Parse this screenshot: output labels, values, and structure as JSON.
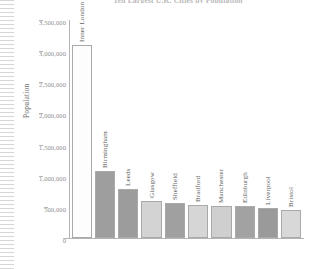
{
  "figure": {
    "title": "Ten Largest U.K. Cities by Population",
    "title_note": "clipped at top edge"
  },
  "axes": {
    "y_axis_title": "Population",
    "y_ticks": [
      "3,500,000",
      "3,000,000",
      "2,500,000",
      "2,000,000",
      "1,500,000",
      "1,000,000",
      "500,000",
      "0"
    ]
  },
  "chart_data": {
    "type": "bar",
    "title": "Ten Largest U.K. Cities by Population",
    "xlabel": "",
    "ylabel": "Population",
    "ylim": [
      0,
      3500000
    ],
    "ytick_values": [
      0,
      500000,
      1000000,
      1500000,
      2000000,
      2500000,
      3000000,
      3500000
    ],
    "ytick_labels": [
      "0",
      "500,000",
      "1,000,000",
      "1,500,000",
      "2,000,000",
      "2,500,000",
      "3,000,000",
      "3,500,000"
    ],
    "grid": false,
    "legend": "none",
    "orientation": "vertical",
    "categories": [
      "Inner London",
      "Birmingham",
      "Leeds",
      "Glasgow",
      "Sheffield",
      "Bradford",
      "Manchester",
      "Edinburgh",
      "Liverpool",
      "Bristol"
    ],
    "values": [
      3100000,
      1080000,
      780000,
      600000,
      560000,
      530000,
      515000,
      510000,
      480000,
      450000
    ],
    "bar_colors": [
      "#fdfdfd",
      "#9e9e9e",
      "#9c9c9c",
      "#d3d3d3",
      "#a0a0a0",
      "#d6d6d6",
      "#cfcfcf",
      "#a2a2a2",
      "#9a9a9a",
      "#d8d8d8"
    ]
  },
  "style": {
    "axis_color": "#b4b4b4",
    "tick_text_color": "#8d8d8d",
    "label_text_color": "#5e5e5e",
    "background": "#ffffff"
  }
}
